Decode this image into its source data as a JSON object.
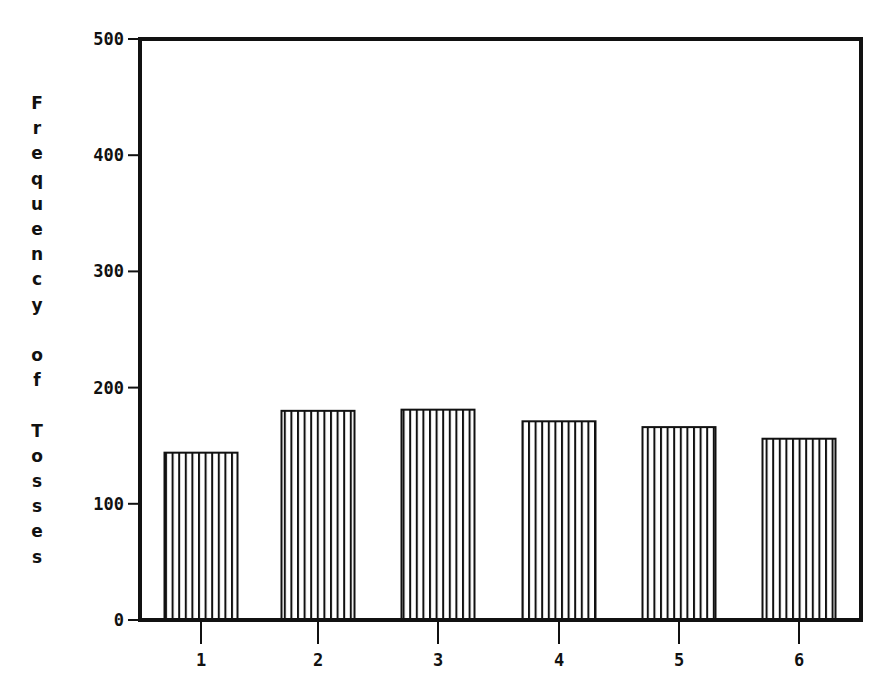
{
  "chart_data": {
    "type": "bar",
    "title": "",
    "xlabel": "",
    "ylabel": "Frequency of Tosses",
    "categories": [
      "1",
      "2",
      "3",
      "4",
      "5",
      "6"
    ],
    "values": [
      144,
      180,
      181,
      171,
      166,
      156
    ],
    "ylim": [
      0,
      500
    ],
    "yticks": [
      "0",
      "100",
      "200",
      "300",
      "400",
      "500"
    ],
    "grid": false,
    "legend": null,
    "bar_fill": "vertical-hatch",
    "colors": {
      "ink": "#111111",
      "background": "#ffffff"
    }
  }
}
